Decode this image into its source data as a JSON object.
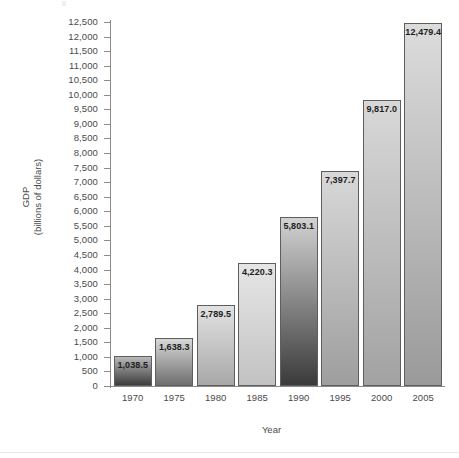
{
  "chart_data": {
    "type": "bar",
    "title": "",
    "xlabel": "Year",
    "ylabel": "GDP\n(billions of dollars)",
    "ylabel_line1": "GDP",
    "ylabel_line2": "(billions of dollars)",
    "categories": [
      "1970",
      "1975",
      "1980",
      "1985",
      "1990",
      "1995",
      "2000",
      "2005"
    ],
    "values": [
      1038.5,
      1638.3,
      2789.5,
      4220.3,
      5803.1,
      7397.7,
      9817.0,
      12479.4
    ],
    "value_labels": [
      "1,038.5",
      "1,638.3",
      "2,789.5",
      "4,220.3",
      "5,803.1",
      "7,397.7",
      "9,817.0",
      "12,479.4"
    ],
    "ylim": [
      0,
      12500
    ],
    "ytick_step": 500,
    "ytick_values": [
      12500,
      12000,
      11500,
      11000,
      10500,
      10000,
      9500,
      9000,
      8500,
      8000,
      7500,
      7000,
      6500,
      6000,
      5500,
      5000,
      4500,
      4000,
      3500,
      3000,
      2500,
      2000,
      1500,
      1000,
      500,
      0
    ],
    "ytick_labels": [
      "12,500",
      "12,000",
      "11,500",
      "11,000",
      "10,500",
      "10,000",
      "9,500",
      "9,000",
      "8,500",
      "8,000",
      "7,500",
      "7,000",
      "6,500",
      "6,000",
      "5,500",
      "5,000",
      "4,500",
      "4,000",
      "3,500",
      "3,000",
      "2,500",
      "2,000",
      "1,500",
      "1,000",
      "500",
      "0"
    ],
    "grid": false,
    "legend": "none",
    "bar_colors_top": [
      "#b9b9b9",
      "#d8d8d8",
      "#e2e2e2",
      "#e6e6e6",
      "#d2d2d2",
      "#d8d8d8",
      "#d8d8d8",
      "#dcdcdc"
    ],
    "bar_colors_bottom": [
      "#3c3c3c",
      "#6e6e6e",
      "#a8a8a8",
      "#c2c2c2",
      "#3a3a3a",
      "#9e9e9e",
      "#a2a2a2",
      "#9a9a9a"
    ],
    "bar_border_color": "#5e5e5e",
    "axis_color": "#8b8b8b",
    "text_color": "#4a4a4a",
    "value_text_color": "#1d1d1d",
    "background": "#ffffff"
  },
  "axis": {
    "x_title": "Year",
    "y_title_line1": "GDP",
    "y_title_line2": "(billions of dollars)"
  }
}
